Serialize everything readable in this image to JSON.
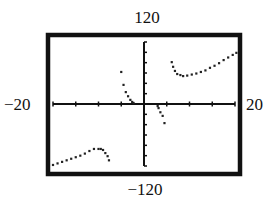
{
  "chart_data": {
    "type": "scatter",
    "title": "",
    "xlabel": "",
    "ylabel": "",
    "window": {
      "xmin": -20,
      "xmax": 20,
      "ymin": -120,
      "ymax": 120,
      "xscl": 5,
      "yscl": 20
    },
    "labels": {
      "ymax": "120",
      "ymin": "−120",
      "xmin": "−20",
      "xmax": "20"
    },
    "grid": false,
    "legend": null,
    "series": [
      {
        "name": "branch-lower-left",
        "points": [
          [
            -20,
            -118
          ],
          [
            -19,
            -115
          ],
          [
            -18,
            -112
          ],
          [
            -17,
            -109
          ],
          [
            -16,
            -106
          ],
          [
            -15,
            -103
          ],
          [
            -14,
            -100
          ],
          [
            -13,
            -96
          ],
          [
            -12,
            -91
          ],
          [
            -11,
            -87
          ],
          [
            -10,
            -87
          ],
          [
            -9.5,
            -87
          ],
          [
            -9,
            -89
          ],
          [
            -8.5,
            -95
          ],
          [
            -8,
            -101
          ],
          [
            -7.7,
            -109
          ]
        ]
      },
      {
        "name": "branch-center-left",
        "points": [
          [
            -5,
            62
          ],
          [
            -4.5,
            37
          ],
          [
            -4,
            23
          ],
          [
            -3.5,
            15
          ],
          [
            -3,
            8
          ],
          [
            -2.6,
            4
          ],
          [
            -2.3,
            2
          ]
        ]
      },
      {
        "name": "branch-center-right",
        "points": [
          [
            3,
            -4
          ],
          [
            3.2,
            -8
          ],
          [
            3.6,
            -16
          ],
          [
            4.1,
            -23
          ],
          [
            4.5,
            -37
          ]
        ]
      },
      {
        "name": "branch-upper-right",
        "points": [
          [
            6.1,
            81
          ],
          [
            6.4,
            72
          ],
          [
            6.8,
            64
          ],
          [
            7.3,
            58
          ],
          [
            8,
            56
          ],
          [
            8.6,
            54
          ],
          [
            9.5,
            55
          ],
          [
            10.5,
            57
          ],
          [
            11.5,
            59
          ],
          [
            12.5,
            62
          ],
          [
            13.5,
            65
          ],
          [
            14.5,
            70
          ],
          [
            15.5,
            74
          ],
          [
            16.5,
            79
          ],
          [
            17.5,
            85
          ],
          [
            18.5,
            90
          ],
          [
            19.5,
            95
          ],
          [
            20.3,
            99
          ]
        ]
      }
    ]
  }
}
